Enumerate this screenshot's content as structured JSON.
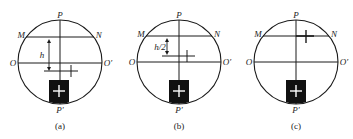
{
  "figure": {
    "colors": {
      "line": "#1a1a1a",
      "box": "#111111",
      "box_cross": "#ffffff",
      "background": "#ffffff"
    },
    "panels": [
      {
        "id": "a",
        "caption": "(a)",
        "labels": {
          "top": "P",
          "bottom": "P′",
          "left_upper": "M",
          "right_upper": "N",
          "left_mid": "O",
          "right_mid": "O′",
          "dimension": "h"
        },
        "circle": {
          "cx": 60,
          "cy": 62,
          "r": 42
        },
        "mn_y": 37,
        "oo_y": 63,
        "reflected_cross": {
          "hline_x1": 44,
          "hline_x2": 78,
          "hline_y": 71,
          "vline_x": 71,
          "vline_y1": 65,
          "vline_y2": 77
        },
        "dimension_arrow": {
          "x": 49,
          "y1": 39,
          "y2": 71
        },
        "box": {
          "x": 49,
          "y": 80,
          "w": 20,
          "h": 25
        }
      },
      {
        "id": "b",
        "caption": "(b)",
        "labels": {
          "top": "P",
          "bottom": "P′",
          "left_upper": "M",
          "right_upper": "N",
          "left_mid": "O",
          "right_mid": "O′",
          "dimension": "h/2"
        },
        "circle": {
          "cx": 179,
          "cy": 62,
          "r": 42
        },
        "mn_y": 36,
        "oo_y": 62,
        "reflected_cross": {
          "hline_x1": 162,
          "hline_x2": 195,
          "hline_y": 56,
          "vline_x": 187,
          "vline_y1": 50,
          "vline_y2": 62
        },
        "dimension_arrow": {
          "x": 167,
          "y1": 38,
          "y2": 55
        },
        "box": {
          "x": 169,
          "y": 80,
          "w": 20,
          "h": 25
        }
      },
      {
        "id": "c",
        "caption": "(c)",
        "labels": {
          "top": "P",
          "bottom": "P′",
          "left_upper": "M",
          "right_upper": "N",
          "left_mid": "O",
          "right_mid": "O′"
        },
        "circle": {
          "cx": 296,
          "cy": 62,
          "r": 42
        },
        "mn_y": 36,
        "oo_y": 62,
        "reflected_cross": {
          "hline_x1": 296,
          "hline_x2": 314,
          "hline_y": 36,
          "vline_x": 306,
          "vline_y1": 30,
          "vline_y2": 43
        },
        "box": {
          "x": 286,
          "y": 80,
          "w": 20,
          "h": 25
        }
      }
    ]
  }
}
